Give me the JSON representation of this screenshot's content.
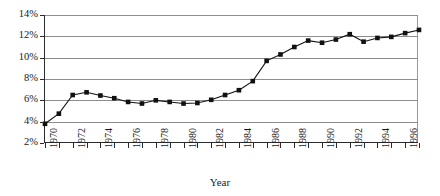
{
  "chart_data": {
    "type": "line",
    "title": "",
    "xlabel": "Year",
    "ylabel": "",
    "xlim": [
      1970,
      1997
    ],
    "ylim": [
      2,
      14
    ],
    "grid": true,
    "legend": false,
    "marker": "square",
    "line_color": "#111111",
    "grid_color": "#8d8d8d",
    "axis_color": "#2b2b2b",
    "y_tick_labels": [
      "14%",
      "12%",
      "10%",
      "8%",
      "6%",
      "4%",
      "2%"
    ],
    "y_tick_values": [
      14,
      12,
      10,
      8,
      6,
      4,
      2
    ],
    "x_tick_values": [
      1970,
      1971,
      1972,
      1973,
      1974,
      1975,
      1976,
      1977,
      1978,
      1979,
      1980,
      1981,
      1982,
      1983,
      1984,
      1985,
      1986,
      1987,
      1988,
      1989,
      1990,
      1991,
      1992,
      1993,
      1994,
      1995,
      1996,
      1997
    ],
    "x_tick_labels": [
      "1970",
      "",
      "1972",
      "",
      "1974",
      "",
      "1976",
      "",
      "1978",
      "",
      "1980",
      "",
      "1982",
      "",
      "1984",
      "",
      "1986",
      "",
      "1988",
      "",
      "1990",
      "",
      "1992",
      "",
      "1994",
      "",
      "1996",
      ""
    ],
    "x": [
      1970,
      1971,
      1972,
      1973,
      1974,
      1975,
      1976,
      1977,
      1978,
      1979,
      1980,
      1981,
      1982,
      1983,
      1984,
      1985,
      1986,
      1987,
      1988,
      1989,
      1990,
      1991,
      1992,
      1993,
      1994,
      1995,
      1996,
      1997
    ],
    "values": [
      3.8,
      4.75,
      6.5,
      6.75,
      6.45,
      6.2,
      5.85,
      5.7,
      6.0,
      5.85,
      5.7,
      5.75,
      6.05,
      6.5,
      6.95,
      7.8,
      9.7,
      10.3,
      11.0,
      11.6,
      11.4,
      11.7,
      12.2,
      11.5,
      11.85,
      11.95,
      12.3,
      12.6
    ]
  }
}
